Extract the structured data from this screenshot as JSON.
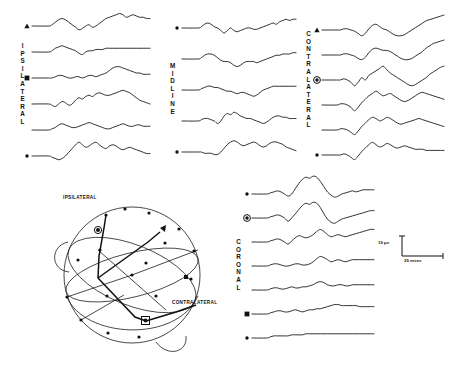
{
  "figure": {
    "type": "evoked-potential-multitrace",
    "background": "#ffffff",
    "ink": "#111111"
  },
  "panels": [
    {
      "id": "ipsilateral",
      "label": "IPSILATERAL",
      "label_letters": [
        "I",
        "P",
        "S",
        "I",
        "L",
        "A",
        "T",
        "E",
        "R",
        "A",
        "L"
      ],
      "trace_count": 6,
      "markers": [
        {
          "trace_index": 0,
          "symbol": "triangle"
        },
        {
          "trace_index": 2,
          "symbol": "square"
        },
        {
          "trace_index": 5,
          "symbol": "dot"
        }
      ]
    },
    {
      "id": "midline",
      "label": "MIDLINE",
      "label_letters": [
        "M",
        "I",
        "D",
        "L",
        "I",
        "N",
        "E"
      ],
      "trace_count": 5,
      "markers": [
        {
          "trace_index": 0,
          "symbol": "dot"
        },
        {
          "trace_index": 4,
          "symbol": "dot"
        }
      ]
    },
    {
      "id": "contralateral",
      "label": "CONTRALATERAL",
      "label_letters": [
        "C",
        "O",
        "N",
        "T",
        "R",
        "A",
        "L",
        "A",
        "T",
        "E",
        "R",
        "A",
        "L"
      ],
      "trace_count": 6,
      "markers": [
        {
          "trace_index": 0,
          "symbol": "triangle"
        },
        {
          "trace_index": 2,
          "symbol": "circled-dot"
        },
        {
          "trace_index": 5,
          "symbol": "dot"
        }
      ]
    },
    {
      "id": "coronal",
      "label": "CORONAL",
      "label_letters": [
        "C",
        "O",
        "R",
        "O",
        "N",
        "A",
        "L"
      ],
      "trace_count": 7,
      "markers": [
        {
          "trace_index": 0,
          "symbol": "dot"
        },
        {
          "trace_index": 1,
          "symbol": "circled-dot"
        },
        {
          "trace_index": 5,
          "symbol": "square"
        },
        {
          "trace_index": 6,
          "symbol": "dot"
        }
      ]
    }
  ],
  "head_diagram": {
    "labels": {
      "ipsilateral": "IPSILATERAL",
      "contralateral": "CONTRALATERAL"
    },
    "markers": [
      {
        "symbol": "circled-dot",
        "position": "ipsilateral-upper-left"
      },
      {
        "symbol": "circled-dot",
        "position": "contralateral-lower-right"
      },
      {
        "symbol": "triangle",
        "position": "upper-right-arc"
      },
      {
        "symbol": "square",
        "position": "right-mid-arc"
      }
    ]
  },
  "calibration": {
    "amplitude": "10 µv",
    "time": "25 msec"
  },
  "chart_data": {
    "type": "line",
    "title": "",
    "xlabel": "25 msec",
    "ylabel": "10 µv",
    "grid": false,
    "legend": "none",
    "note": "Averaged evoked potential traces; each path is a normalized waveform sampled as y-offsets along a common time base.",
    "panels": {
      "ipsilateral": [
        [
          0,
          -1,
          -3,
          -5,
          -6,
          -5,
          -3,
          -1,
          1,
          3,
          2,
          0,
          -1,
          1,
          0,
          -2,
          -4,
          -6,
          -7,
          -8,
          -9,
          -10,
          -9,
          -7,
          -8,
          -9,
          -8,
          -7,
          -7,
          -6,
          -6
        ],
        [
          0,
          -1,
          -3,
          -4,
          -5,
          -4,
          -3,
          -2,
          -1,
          1,
          2,
          0,
          -1,
          -1,
          -2,
          -2,
          -2,
          -3,
          -3,
          -3,
          -3,
          -3,
          -3,
          -3,
          -3,
          -3,
          -3,
          -3,
          -3,
          -3,
          -3
        ],
        [
          0,
          0,
          -1,
          -2,
          -2,
          -1,
          0,
          0,
          -1,
          -1,
          0,
          -1,
          -2,
          -2,
          -1,
          -2,
          -3,
          -4,
          -6,
          -8,
          -9,
          -9,
          -8,
          -7,
          -6,
          -5,
          -4,
          -4,
          -3,
          -3,
          -3
        ],
        [
          0,
          1,
          2,
          0,
          -2,
          -1,
          1,
          0,
          -3,
          -5,
          -4,
          -6,
          -7,
          -6,
          -8,
          -9,
          -8,
          -7,
          -7,
          -8,
          -9,
          -10,
          -11,
          -10,
          -9,
          -7,
          -5,
          -3,
          -2,
          -1,
          0
        ],
        [
          0,
          -1,
          -2,
          -4,
          -5,
          -4,
          -3,
          -2,
          -2,
          -3,
          -4,
          -5,
          -6,
          -5,
          -4,
          -3,
          -2,
          -1,
          -1,
          -2,
          -3,
          -4,
          -5,
          -4,
          -3,
          -3,
          -4,
          -4,
          -3,
          -3,
          -3
        ],
        [
          0,
          1,
          2,
          3,
          2,
          0,
          -3,
          -6,
          -9,
          -11,
          -9,
          -7,
          -8,
          -10,
          -11,
          -9,
          -7,
          -6,
          -8,
          -9,
          -8,
          -6,
          -5,
          -6,
          -7,
          -6,
          -5,
          -4,
          -3,
          -2,
          -2
        ]
      ],
      "midline": [
        [
          0,
          -1,
          -3,
          -4,
          -3,
          -1,
          0,
          2,
          4,
          2,
          0,
          2,
          3,
          2,
          1,
          0,
          0,
          1,
          1,
          0,
          -1,
          -2,
          -3,
          -4,
          -3,
          -5,
          -6,
          -7,
          -6,
          -7,
          -7
        ],
        [
          0,
          -1,
          -3,
          -4,
          -4,
          -3,
          -1,
          1,
          2,
          2,
          3,
          5,
          6,
          5,
          3,
          2,
          2,
          2,
          3,
          2,
          1,
          0,
          -1,
          -2,
          -3,
          -3,
          -4,
          -4,
          -4,
          -5,
          -5
        ],
        [
          0,
          -1,
          -2,
          -3,
          -3,
          -2,
          -2,
          -1,
          0,
          1,
          1,
          2,
          3,
          2,
          2,
          3,
          4,
          5,
          4,
          2,
          0,
          -1,
          -2,
          -3,
          -3,
          -3,
          -3,
          -3,
          -3,
          -3,
          -3
        ],
        [
          0,
          -1,
          -2,
          -2,
          -1,
          0,
          2,
          0,
          -4,
          -6,
          -5,
          -7,
          -6,
          -4,
          -3,
          -2,
          -2,
          -1,
          0,
          1,
          2,
          1,
          -1,
          -3,
          -4,
          -4,
          -3,
          -3,
          -2,
          -2,
          -2
        ],
        [
          0,
          0,
          1,
          1,
          1,
          2,
          2,
          0,
          -3,
          -6,
          -8,
          -9,
          -8,
          -6,
          -5,
          -6,
          -7,
          -8,
          -7,
          -5,
          -4,
          -5,
          -7,
          -8,
          -8,
          -7,
          -6,
          -4,
          -3,
          -2,
          -1
        ]
      ],
      "contralateral": [
        [
          0,
          0,
          -1,
          -1,
          0,
          1,
          3,
          5,
          3,
          -1,
          -4,
          -5,
          -3,
          -1,
          0,
          2,
          4,
          5,
          5,
          4,
          2,
          0,
          -2,
          -4,
          -6,
          -8,
          -9,
          -10,
          -11,
          -12,
          -13
        ],
        [
          0,
          0,
          -1,
          -1,
          0,
          1,
          3,
          4,
          2,
          -2,
          -5,
          -6,
          -5,
          -4,
          -4,
          -3,
          -1,
          1,
          3,
          4,
          4,
          3,
          1,
          -1,
          -3,
          -6,
          -8,
          -10,
          -11,
          -12,
          -13
        ],
        [
          0,
          0,
          -1,
          0,
          2,
          5,
          2,
          -2,
          0,
          -4,
          -6,
          -8,
          -10,
          -12,
          -9,
          -6,
          -4,
          -2,
          0,
          2,
          4,
          5,
          4,
          2,
          0,
          -2,
          -5,
          -7,
          -9,
          -11,
          -12
        ],
        [
          0,
          -1,
          -1,
          0,
          2,
          5,
          2,
          -2,
          -5,
          -8,
          -10,
          -12,
          -10,
          -8,
          -9,
          -10,
          -8,
          -6,
          -4,
          -3,
          -4,
          -6,
          -8,
          -10,
          -11,
          -10,
          -9,
          -8,
          -7,
          -6,
          -5
        ],
        [
          0,
          -1,
          -1,
          0,
          2,
          4,
          1,
          -3,
          -6,
          -9,
          -11,
          -10,
          -8,
          -9,
          -11,
          -10,
          -8,
          -6,
          -5,
          -6,
          -7,
          -8,
          -9,
          -10,
          -9,
          -8,
          -7,
          -6,
          -5,
          -4,
          -3
        ],
        [
          0,
          0,
          -1,
          0,
          2,
          4,
          1,
          -3,
          -6,
          -9,
          -11,
          -9,
          -7,
          -8,
          -10,
          -9,
          -7,
          -6,
          -7,
          -8,
          -7,
          -6,
          -5,
          -5,
          -5,
          -4,
          -4,
          -4,
          -4,
          -4,
          -4
        ]
      ],
      "coronal": [
        [
          0,
          -1,
          -2,
          -3,
          -2,
          0,
          2,
          0,
          -5,
          -10,
          -14,
          -16,
          -15,
          -17,
          -16,
          -12,
          -7,
          -2,
          1,
          3,
          2,
          0,
          -1,
          -2,
          -3,
          -2,
          -3,
          -4,
          -4,
          -4,
          -4
        ],
        [
          0,
          -1,
          -2,
          -3,
          -2,
          0,
          3,
          0,
          -4,
          -8,
          -12,
          -14,
          -13,
          -15,
          -14,
          -10,
          -4,
          1,
          4,
          5,
          3,
          1,
          0,
          -1,
          -2,
          -3,
          -4,
          -5,
          -6,
          -7,
          -7
        ],
        [
          0,
          -1,
          -2,
          -3,
          -2,
          0,
          2,
          -1,
          -4,
          -6,
          -5,
          -4,
          -5,
          -7,
          -10,
          -12,
          -10,
          -7,
          -5,
          -6,
          -7,
          -6,
          -5,
          -6,
          -7,
          -8,
          -9,
          -10,
          -11,
          -12,
          -12
        ],
        [
          0,
          -1,
          -2,
          -2,
          -1,
          0,
          0,
          -1,
          -2,
          -2,
          -1,
          -1,
          -2,
          -4,
          -7,
          -9,
          -8,
          -6,
          -4,
          -5,
          -6,
          -5,
          -4,
          -5,
          -6,
          -6,
          -6,
          -6,
          -6,
          -6,
          -6
        ],
        [
          0,
          -1,
          -2,
          -2,
          -1,
          -1,
          -2,
          -3,
          -2,
          -2,
          -3,
          -3,
          -4,
          -5,
          -7,
          -8,
          -7,
          -5,
          -4,
          -4,
          -5,
          -5,
          -4,
          -4,
          -5,
          -5,
          -5,
          -5,
          -5,
          -5,
          -5
        ],
        [
          0,
          -1,
          -2,
          -3,
          -3,
          -2,
          -2,
          -3,
          -4,
          -3,
          -2,
          -3,
          -4,
          -4,
          -5,
          -5,
          -6,
          -7,
          -8,
          -9,
          -9,
          -8,
          -8,
          -8,
          -8,
          -8,
          -7,
          -7,
          -7,
          -7,
          -7
        ],
        [
          0,
          -1,
          -2,
          -2,
          -2,
          -2,
          -2,
          -3,
          -3,
          -3,
          -3,
          -4,
          -4,
          -4,
          -4,
          -4,
          -4,
          -4,
          -4,
          -4,
          -4,
          -4,
          -4,
          -4,
          -4,
          -4,
          -4,
          -4,
          -4,
          -4,
          -4
        ]
      ]
    }
  }
}
